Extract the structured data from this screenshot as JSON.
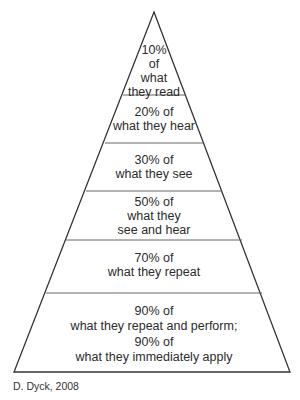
{
  "diagram": {
    "tiers": [
      {
        "lines": [
          "10%",
          "of",
          "what",
          "they read"
        ]
      },
      {
        "lines": [
          "20% of",
          "what they hear"
        ]
      },
      {
        "lines": [
          "30% of",
          "what they see"
        ]
      },
      {
        "lines": [
          "50% of",
          "what they",
          "see and hear"
        ]
      },
      {
        "lines": [
          "70% of",
          "what they repeat"
        ]
      },
      {
        "lines": [
          "90% of",
          "what they repeat and perform;",
          "90% of",
          "what they immediately apply"
        ]
      }
    ],
    "caption": "D. Dyck, 2008",
    "colors": {
      "stroke": "#333333",
      "divider": "#666666",
      "background": "#ffffff"
    }
  }
}
